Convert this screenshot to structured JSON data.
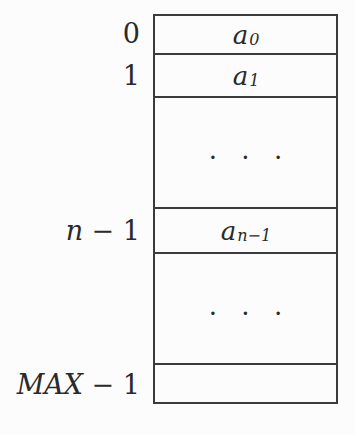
{
  "figure": {
    "index_column": {
      "row0": "0",
      "row1": "1",
      "rowN": {
        "var": "n",
        "rest": " − 1"
      },
      "rowMax": {
        "var": "MAX",
        "rest": " − 1"
      }
    },
    "array_box": {
      "cell0": {
        "var": "a",
        "sub": "0"
      },
      "cell1": {
        "var": "a",
        "sub": "1"
      },
      "ellipsis1": ". . .",
      "cellN": {
        "var": "a",
        "sub": "n−1"
      },
      "ellipsis2": ". . .",
      "cellMax": ""
    },
    "colors": {
      "background": "#fcfcfc",
      "line": "#3b3b3b",
      "text": "#2a2a2a"
    }
  }
}
